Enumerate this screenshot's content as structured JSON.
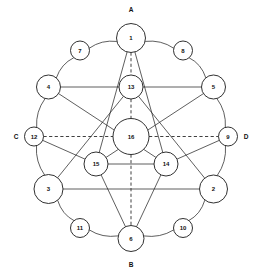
{
  "figure": {
    "background_color": "#ffffff",
    "stroke_color": "#2a2a2a",
    "node_fill": "#ffffff",
    "width": 262,
    "height": 273
  },
  "axis_labels": [
    {
      "name": "axis-label-a",
      "text": "A",
      "x": 131,
      "y": 9
    },
    {
      "name": "axis-label-b",
      "text": "B",
      "x": 131,
      "y": 264.5
    },
    {
      "name": "axis-label-c",
      "text": "C",
      "x": 16,
      "y": 136.5
    },
    {
      "name": "axis-label-d",
      "text": "D",
      "x": 246,
      "y": 136.5
    }
  ],
  "nodes": [
    {
      "id": "1",
      "label": "1",
      "x": 131,
      "y": 38,
      "r": 14.5,
      "ring": "outer"
    },
    {
      "id": "8",
      "label": "8",
      "x": 183,
      "y": 50.5,
      "r": 9.5,
      "ring": "outer"
    },
    {
      "id": "5",
      "label": "5",
      "x": 213.5,
      "y": 87,
      "r": 12,
      "ring": "outer"
    },
    {
      "id": "9",
      "label": "9",
      "x": 228,
      "y": 136.5,
      "r": 9.5,
      "ring": "outer"
    },
    {
      "id": "2",
      "label": "2",
      "x": 213.5,
      "y": 189,
      "r": 14,
      "ring": "outer"
    },
    {
      "id": "10",
      "label": "10",
      "x": 183,
      "y": 228,
      "r": 9.5,
      "ring": "outer"
    },
    {
      "id": "6",
      "label": "6",
      "x": 131,
      "y": 238.5,
      "r": 13,
      "ring": "outer"
    },
    {
      "id": "11",
      "label": "11",
      "x": 80,
      "y": 228,
      "r": 9.5,
      "ring": "outer"
    },
    {
      "id": "3",
      "label": "3",
      "x": 48.5,
      "y": 189,
      "r": 14.5,
      "ring": "outer"
    },
    {
      "id": "12",
      "label": "12",
      "x": 34,
      "y": 136.5,
      "r": 9.5,
      "ring": "outer"
    },
    {
      "id": "4",
      "label": "4",
      "x": 48.5,
      "y": 87,
      "r": 12,
      "ring": "outer"
    },
    {
      "id": "7",
      "label": "7",
      "x": 80,
      "y": 50.5,
      "r": 9.5,
      "ring": "outer"
    },
    {
      "id": "13",
      "label": "13",
      "x": 131,
      "y": 87,
      "r": 12,
      "ring": "inner"
    },
    {
      "id": "15",
      "label": "15",
      "x": 96,
      "y": 164,
      "r": 12,
      "ring": "inner"
    },
    {
      "id": "14",
      "label": "14",
      "x": 166,
      "y": 164,
      "r": 12,
      "ring": "inner"
    },
    {
      "id": "16",
      "label": "16",
      "x": 131,
      "y": 136.5,
      "r": 18,
      "ring": "center"
    }
  ],
  "edges_arc": [
    {
      "from": "1",
      "to": "8"
    },
    {
      "from": "8",
      "to": "5"
    },
    {
      "from": "5",
      "to": "9"
    },
    {
      "from": "9",
      "to": "2"
    },
    {
      "from": "2",
      "to": "10"
    },
    {
      "from": "10",
      "to": "6"
    },
    {
      "from": "6",
      "to": "11"
    },
    {
      "from": "11",
      "to": "3"
    },
    {
      "from": "3",
      "to": "12"
    },
    {
      "from": "12",
      "to": "4"
    },
    {
      "from": "4",
      "to": "7"
    },
    {
      "from": "7",
      "to": "1"
    }
  ],
  "edges_solid": [
    {
      "from": "4",
      "to": "13"
    },
    {
      "from": "13",
      "to": "5"
    },
    {
      "from": "15",
      "to": "14"
    },
    {
      "from": "3",
      "to": "2"
    },
    {
      "from": "1",
      "to": "15"
    },
    {
      "from": "1",
      "to": "14"
    },
    {
      "from": "6",
      "to": "15"
    },
    {
      "from": "6",
      "to": "14"
    },
    {
      "from": "4",
      "to": "14"
    },
    {
      "from": "5",
      "to": "15"
    },
    {
      "from": "3",
      "to": "13"
    },
    {
      "from": "2",
      "to": "13"
    },
    {
      "from": "12",
      "to": "15"
    },
    {
      "from": "9",
      "to": "14"
    }
  ],
  "edges_dashed": [
    {
      "from": "1",
      "to": "13"
    },
    {
      "from": "13",
      "to": "16"
    },
    {
      "from": "16",
      "to": "6"
    },
    {
      "from": "12",
      "to": "16"
    },
    {
      "from": "16",
      "to": "9"
    }
  ]
}
